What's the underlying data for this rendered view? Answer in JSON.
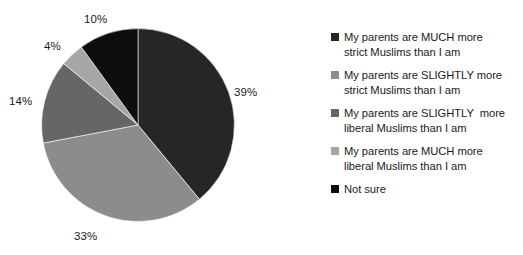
{
  "chart_data": {
    "type": "pie",
    "title": "",
    "xlabel": "",
    "ylabel": "",
    "legend_position": "right",
    "grid": false,
    "categories": [
      "My parents are MUCH more strict Muslims than I am",
      "My parents are SLIGHTLY more strict Muslims than I am",
      "My parents are SLIGHTLY  more liberal Muslims than I am",
      "My parents are MUCH more liberal Muslims than I am",
      "Not sure"
    ],
    "values": [
      39,
      33,
      14,
      4,
      10
    ],
    "value_labels": [
      "39%",
      "33%",
      "14%",
      "4%",
      "10%"
    ],
    "colors": [
      "#262626",
      "#8c8c8c",
      "#666666",
      "#a6a6a6",
      "#0d0d0d"
    ],
    "start_angle_deg": 0,
    "direction": "clockwise",
    "units": "percent"
  },
  "legend": {
    "items": [
      {
        "label": "My parents are MUCH more\nstrict Muslims than I am",
        "color": "#262626"
      },
      {
        "label": "My parents are SLIGHTLY more\nstrict Muslims than I am",
        "color": "#8c8c8c"
      },
      {
        "label": "My parents are SLIGHTLY  more\nliberal Muslims than I am",
        "color": "#666666"
      },
      {
        "label": "My parents are MUCH more\nliberal Muslims than I am",
        "color": "#a6a6a6"
      },
      {
        "label": "Not sure",
        "color": "#0d0d0d"
      }
    ]
  },
  "labels": {
    "pct_0": "39%",
    "pct_1": "33%",
    "pct_2": "14%",
    "pct_3": "4%",
    "pct_4": "10%"
  }
}
